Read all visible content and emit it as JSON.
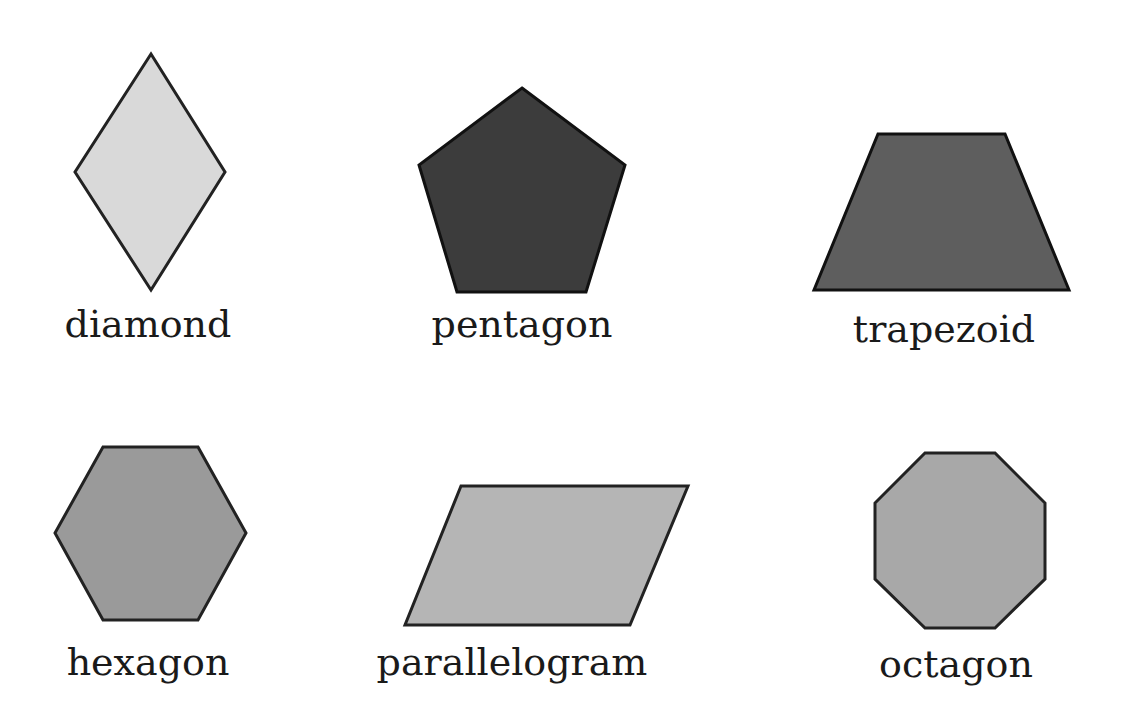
{
  "figure": {
    "title": "",
    "shapes": [
      {
        "name": "diamond",
        "label": "diamond",
        "fill": "#d9d9d9",
        "stroke": "#222222",
        "points": "151,54 225,172 151,290 75,172",
        "label_x": 148,
        "label_y": 305
      },
      {
        "name": "pentagon",
        "label": "pentagon",
        "fill": "#3c3c3c",
        "stroke": "#111111",
        "points": "522,88 625,165 586,292 457,292 419,165",
        "label_x": 522,
        "label_y": 305
      },
      {
        "name": "trapezoid",
        "label": "trapezoid",
        "fill": "#5e5e5e",
        "stroke": "#111111",
        "points": "878,134 1005,134 1069,290 814,290",
        "label_x": 944,
        "label_y": 310
      },
      {
        "name": "hexagon",
        "label": "hexagon",
        "fill": "#9a9a9a",
        "stroke": "#222222",
        "points": "103,447 198,447 246,533 198,620 103,620 55,533",
        "label_x": 148,
        "label_y": 643
      },
      {
        "name": "parallelogram",
        "label": "parallelogram",
        "fill": "#b5b5b5",
        "stroke": "#222222",
        "points": "461,486 688,486 630,625 405,625",
        "label_x": 512,
        "label_y": 643
      },
      {
        "name": "octagon",
        "label": "octagon",
        "fill": "#a8a8a8",
        "stroke": "#222222",
        "points": "925,453 995,453 1045,503 1045,579 995,628 925,628 875,579 875,503",
        "label_x": 956,
        "label_y": 645
      }
    ]
  }
}
